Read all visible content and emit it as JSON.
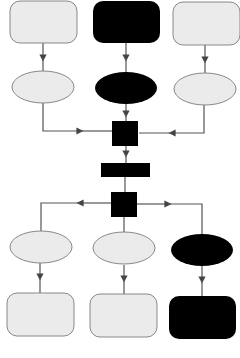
{
  "diagram": {
    "type": "flowchart",
    "colors": {
      "light_fill": "#ebebeb",
      "dark_fill": "#000000",
      "stroke": "#777777",
      "line": "#555555"
    },
    "nodes": [
      {
        "id": "top-left-box",
        "shape": "rounded-rect",
        "fill": "light",
        "label": ""
      },
      {
        "id": "top-center-box",
        "shape": "rounded-rect",
        "fill": "dark",
        "label": ""
      },
      {
        "id": "top-right-box",
        "shape": "rounded-rect",
        "fill": "light",
        "label": ""
      },
      {
        "id": "upper-left-ellipse",
        "shape": "ellipse",
        "fill": "light",
        "label": ""
      },
      {
        "id": "upper-center-ellipse",
        "shape": "ellipse",
        "fill": "dark",
        "label": ""
      },
      {
        "id": "upper-right-ellipse",
        "shape": "ellipse",
        "fill": "light",
        "label": ""
      },
      {
        "id": "merge-square",
        "shape": "square",
        "fill": "dark",
        "label": ""
      },
      {
        "id": "middle-bar",
        "shape": "rect",
        "fill": "dark",
        "label": ""
      },
      {
        "id": "split-square",
        "shape": "square",
        "fill": "dark",
        "label": ""
      },
      {
        "id": "lower-left-ellipse",
        "shape": "ellipse",
        "fill": "light",
        "label": ""
      },
      {
        "id": "lower-center-ellipse",
        "shape": "ellipse",
        "fill": "light",
        "label": ""
      },
      {
        "id": "lower-right-ellipse",
        "shape": "ellipse",
        "fill": "dark",
        "label": ""
      },
      {
        "id": "bottom-left-box",
        "shape": "rounded-rect",
        "fill": "light",
        "label": ""
      },
      {
        "id": "bottom-center-box",
        "shape": "rounded-rect",
        "fill": "light",
        "label": ""
      },
      {
        "id": "bottom-right-box",
        "shape": "rounded-rect",
        "fill": "dark",
        "label": ""
      }
    ],
    "edges": [
      {
        "from": "top-left-box",
        "to": "upper-left-ellipse"
      },
      {
        "from": "top-center-box",
        "to": "upper-center-ellipse"
      },
      {
        "from": "top-right-box",
        "to": "upper-right-ellipse"
      },
      {
        "from": "upper-left-ellipse",
        "to": "merge-square"
      },
      {
        "from": "upper-center-ellipse",
        "to": "merge-square"
      },
      {
        "from": "upper-right-ellipse",
        "to": "merge-square"
      },
      {
        "from": "merge-square",
        "to": "middle-bar"
      },
      {
        "from": "middle-bar",
        "to": "split-square"
      },
      {
        "from": "split-square",
        "to": "lower-left-ellipse"
      },
      {
        "from": "split-square",
        "to": "lower-center-ellipse"
      },
      {
        "from": "split-square",
        "to": "lower-right-ellipse"
      },
      {
        "from": "lower-left-ellipse",
        "to": "bottom-left-box"
      },
      {
        "from": "lower-center-ellipse",
        "to": "bottom-center-box"
      },
      {
        "from": "lower-right-ellipse",
        "to": "bottom-right-box"
      }
    ]
  }
}
